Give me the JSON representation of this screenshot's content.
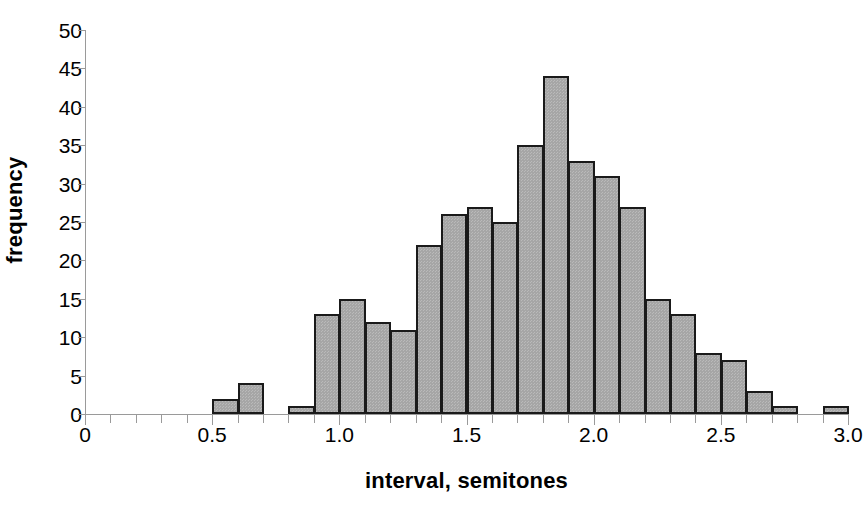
{
  "chart_data": {
    "type": "bar",
    "title": "",
    "subtitle": "",
    "xlabel": "interval, semitones",
    "ylabel": "frequency",
    "xlim": [
      0,
      3.0
    ],
    "ylim": [
      0,
      50
    ],
    "ytick_labels": [
      "0",
      "5",
      "10",
      "15",
      "20",
      "25",
      "30",
      "35",
      "40",
      "45",
      "50"
    ],
    "ytick_values": [
      0,
      5,
      10,
      15,
      20,
      25,
      30,
      35,
      40,
      45,
      50
    ],
    "xtick_labels": [
      "0",
      "0.5",
      "1.0",
      "1.5",
      "2.0",
      "2.5",
      "3.0"
    ],
    "xtick_values": [
      0,
      0.5,
      1.0,
      1.5,
      2.0,
      2.5,
      3.0
    ],
    "minor_xtick_step": 0.1,
    "grid": false,
    "legend": null,
    "bin_width": 0.1,
    "bar_fill_color": "#a6a6a6",
    "bar_edge_color": "#1a1a1a",
    "axis_color": "#9a9a9a",
    "bins": [
      {
        "x0": 0.0,
        "x1": 0.1,
        "value": 0
      },
      {
        "x0": 0.1,
        "x1": 0.2,
        "value": 0
      },
      {
        "x0": 0.2,
        "x1": 0.3,
        "value": 0
      },
      {
        "x0": 0.3,
        "x1": 0.4,
        "value": 0
      },
      {
        "x0": 0.4,
        "x1": 0.5,
        "value": 0
      },
      {
        "x0": 0.5,
        "x1": 0.6,
        "value": 2
      },
      {
        "x0": 0.6,
        "x1": 0.7,
        "value": 4
      },
      {
        "x0": 0.7,
        "x1": 0.8,
        "value": 0
      },
      {
        "x0": 0.8,
        "x1": 0.9,
        "value": 1
      },
      {
        "x0": 0.9,
        "x1": 1.0,
        "value": 13
      },
      {
        "x0": 1.0,
        "x1": 1.1,
        "value": 15
      },
      {
        "x0": 1.1,
        "x1": 1.2,
        "value": 12
      },
      {
        "x0": 1.2,
        "x1": 1.3,
        "value": 11
      },
      {
        "x0": 1.3,
        "x1": 1.4,
        "value": 22
      },
      {
        "x0": 1.4,
        "x1": 1.5,
        "value": 26
      },
      {
        "x0": 1.5,
        "x1": 1.6,
        "value": 27
      },
      {
        "x0": 1.6,
        "x1": 1.7,
        "value": 25
      },
      {
        "x0": 1.7,
        "x1": 1.8,
        "value": 35
      },
      {
        "x0": 1.8,
        "x1": 1.9,
        "value": 44
      },
      {
        "x0": 1.9,
        "x1": 2.0,
        "value": 33
      },
      {
        "x0": 2.0,
        "x1": 2.1,
        "value": 31
      },
      {
        "x0": 2.1,
        "x1": 2.2,
        "value": 27
      },
      {
        "x0": 2.2,
        "x1": 2.3,
        "value": 15
      },
      {
        "x0": 2.3,
        "x1": 2.4,
        "value": 13
      },
      {
        "x0": 2.4,
        "x1": 2.5,
        "value": 8
      },
      {
        "x0": 2.5,
        "x1": 2.6,
        "value": 7
      },
      {
        "x0": 2.6,
        "x1": 2.7,
        "value": 3
      },
      {
        "x0": 2.7,
        "x1": 2.8,
        "value": 1
      },
      {
        "x0": 2.8,
        "x1": 2.9,
        "value": 0
      },
      {
        "x0": 2.9,
        "x1": 3.0,
        "value": 1
      }
    ]
  }
}
